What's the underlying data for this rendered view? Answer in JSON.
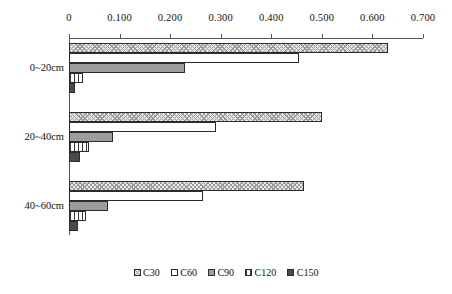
{
  "chart_data": {
    "type": "bar",
    "orientation": "horizontal",
    "title": "",
    "xlabel": "",
    "ylabel": "",
    "categories": [
      "0~20cm",
      "20~40cm",
      "40~60cm"
    ],
    "series": [
      {
        "name": "C30",
        "values": [
          0.63,
          0.5,
          0.465
        ]
      },
      {
        "name": "C60",
        "values": [
          0.455,
          0.29,
          0.265
        ]
      },
      {
        "name": "C90",
        "values": [
          0.23,
          0.087,
          0.077
        ]
      },
      {
        "name": "C120",
        "values": [
          0.027,
          0.04,
          0.033
        ]
      },
      {
        "name": "C150",
        "values": [
          0.012,
          0.022,
          0.018
        ]
      }
    ],
    "xlim": [
      0,
      0.7
    ],
    "xticks": [
      0,
      0.1,
      0.2,
      0.3,
      0.4,
      0.5,
      0.6,
      0.7
    ],
    "xtick_labels": [
      "0",
      "0.100",
      "0.200",
      "0.300",
      "0.400",
      "0.500",
      "0.600",
      "0.700"
    ],
    "grid": false,
    "axis_position": "top",
    "legend_position": "bottom",
    "legend_entries": [
      "C30",
      "C60",
      "C90",
      "C120",
      "C150"
    ],
    "patterns": {
      "C30": "crosshatch",
      "C60": "solid-white",
      "C90": "solid-gray",
      "C120": "vertical-stripes",
      "C150": "solid-dark"
    },
    "colors": {
      "C30": "#e9e9e9",
      "C60": "#ffffff",
      "C90": "#9c9c9c",
      "C120": "#ffffff",
      "C150": "#4a4a4a",
      "outline": "#2b2b2b",
      "axis": "#555555"
    }
  }
}
